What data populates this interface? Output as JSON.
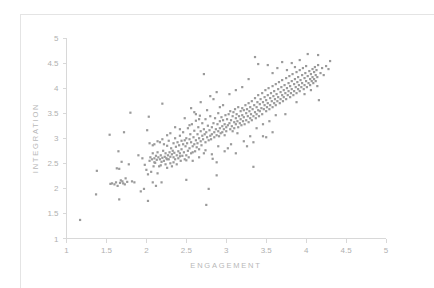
{
  "chart_data": {
    "type": "scatter",
    "title": "",
    "xlabel": "ENGAGEMENT",
    "ylabel": "INTEGRATION",
    "xlim": [
      1,
      5
    ],
    "ylim": [
      1,
      5
    ],
    "xticks": [
      1,
      1.5,
      2,
      2.5,
      3,
      3.5,
      4,
      4.5,
      5
    ],
    "yticks": [
      1,
      1.5,
      2,
      2.5,
      3,
      3.5,
      4,
      4.5,
      5
    ],
    "xtick_labels": [
      "1",
      "1.5",
      "2",
      "2.5",
      "3",
      "3.5",
      "4",
      "4.5",
      "5"
    ],
    "ytick_labels": [
      "1",
      "1.5",
      "2",
      "2.5",
      "3",
      "3.5",
      "4",
      "4.5",
      "5"
    ],
    "grid": false,
    "legend": null,
    "marker": "square",
    "marker_size": 2.2,
    "marker_color": "#9a9a9a",
    "axis_color": "#d8d8d8",
    "label_color": "#b4b4b4",
    "n_points": 392,
    "correlation": 0.85,
    "points": [
      [
        1.17,
        1.37
      ],
      [
        1.37,
        1.88
      ],
      [
        1.38,
        2.35
      ],
      [
        1.54,
        3.07
      ],
      [
        1.55,
        2.09
      ],
      [
        1.57,
        2.1
      ],
      [
        1.6,
        2.08
      ],
      [
        1.62,
        2.12
      ],
      [
        1.63,
        2.4
      ],
      [
        1.64,
        2.05
      ],
      [
        1.65,
        2.74
      ],
      [
        1.66,
        2.39
      ],
      [
        1.66,
        1.78
      ],
      [
        1.67,
        2.11
      ],
      [
        1.68,
        2.16
      ],
      [
        1.69,
        2.53
      ],
      [
        1.7,
        2.14
      ],
      [
        1.71,
        2.1
      ],
      [
        1.72,
        3.12
      ],
      [
        1.73,
        2.08
      ],
      [
        1.74,
        2.2
      ],
      [
        1.76,
        2.13
      ],
      [
        1.78,
        2.48
      ],
      [
        1.8,
        3.51
      ],
      [
        1.82,
        2.14
      ],
      [
        1.85,
        2.12
      ],
      [
        1.9,
        2.66
      ],
      [
        1.93,
        1.94
      ],
      [
        1.95,
        2.6
      ],
      [
        1.97,
        1.99
      ],
      [
        1.98,
        2.47
      ],
      [
        2.0,
        2.37
      ],
      [
        2.01,
        3.16
      ],
      [
        2.02,
        2.28
      ],
      [
        2.02,
        1.75
      ],
      [
        2.03,
        3.43
      ],
      [
        2.04,
        2.55
      ],
      [
        2.05,
        2.62
      ],
      [
        2.06,
        2.33
      ],
      [
        2.07,
        2.58
      ],
      [
        2.08,
        2.12
      ],
      [
        2.08,
        2.7
      ],
      [
        2.09,
        2.44
      ],
      [
        2.1,
        2.6
      ],
      [
        2.1,
        2.88
      ],
      [
        2.11,
        2.51
      ],
      [
        2.12,
        2.65
      ],
      [
        2.12,
        2.05
      ],
      [
        2.13,
        2.57
      ],
      [
        2.14,
        2.72
      ],
      [
        2.14,
        2.3
      ],
      [
        2.15,
        2.62
      ],
      [
        2.16,
        2.44
      ],
      [
        2.17,
        2.58
      ],
      [
        2.17,
        2.92
      ],
      [
        2.18,
        2.66
      ],
      [
        2.19,
        2.53
      ],
      [
        2.19,
        2.12
      ],
      [
        2.2,
        2.61
      ],
      [
        2.2,
        3.69
      ],
      [
        2.21,
        2.75
      ],
      [
        2.22,
        2.55
      ],
      [
        2.22,
        2.88
      ],
      [
        2.23,
        2.63
      ],
      [
        2.24,
        2.48
      ],
      [
        2.24,
        2.7
      ],
      [
        2.25,
        2.6
      ],
      [
        2.26,
        2.85
      ],
      [
        2.26,
        2.41
      ],
      [
        2.27,
        2.66
      ],
      [
        2.28,
        2.58
      ],
      [
        2.28,
        2.95
      ],
      [
        2.29,
        2.72
      ],
      [
        2.3,
        2.63
      ],
      [
        2.3,
        2.5
      ],
      [
        2.31,
        2.8
      ],
      [
        2.32,
        2.68
      ],
      [
        2.32,
        2.44
      ],
      [
        2.33,
        2.75
      ],
      [
        2.34,
        2.9
      ],
      [
        2.34,
        2.62
      ],
      [
        2.35,
        2.71
      ],
      [
        2.36,
        2.58
      ],
      [
        2.36,
        3.0
      ],
      [
        2.37,
        2.83
      ],
      [
        2.38,
        2.66
      ],
      [
        2.38,
        2.48
      ],
      [
        2.39,
        2.92
      ],
      [
        2.4,
        2.74
      ],
      [
        2.4,
        2.6
      ],
      [
        2.41,
        2.86
      ],
      [
        2.42,
        2.7
      ],
      [
        2.42,
        3.05
      ],
      [
        2.43,
        2.55
      ],
      [
        2.44,
        2.95
      ],
      [
        2.44,
        2.78
      ],
      [
        2.45,
        2.65
      ],
      [
        2.46,
        2.88
      ],
      [
        2.46,
        3.12
      ],
      [
        2.47,
        2.72
      ],
      [
        2.48,
        2.96
      ],
      [
        2.48,
        2.58
      ],
      [
        2.49,
        2.84
      ],
      [
        2.5,
        3.0
      ],
      [
        2.5,
        2.66
      ],
      [
        2.5,
        2.17
      ],
      [
        2.51,
        2.9
      ],
      [
        2.52,
        2.75
      ],
      [
        2.52,
        3.2
      ],
      [
        2.53,
        2.62
      ],
      [
        2.54,
        2.98
      ],
      [
        2.54,
        2.8
      ],
      [
        2.55,
        3.08
      ],
      [
        2.56,
        2.7
      ],
      [
        2.56,
        2.92
      ],
      [
        2.57,
        3.28
      ],
      [
        2.58,
        2.84
      ],
      [
        2.58,
        2.55
      ],
      [
        2.59,
        3.02
      ],
      [
        2.6,
        2.88
      ],
      [
        2.6,
        3.15
      ],
      [
        2.61,
        2.74
      ],
      [
        2.62,
        2.96
      ],
      [
        2.62,
        3.35
      ],
      [
        2.63,
        2.82
      ],
      [
        2.64,
        3.08
      ],
      [
        2.64,
        2.9
      ],
      [
        2.65,
        3.22
      ],
      [
        2.66,
        2.78
      ],
      [
        2.66,
        3.0
      ],
      [
        2.67,
        3.45
      ],
      [
        2.68,
        2.94
      ],
      [
        2.68,
        3.14
      ],
      [
        2.69,
        2.86
      ],
      [
        2.7,
        3.05
      ],
      [
        2.7,
        3.3
      ],
      [
        2.71,
        2.98
      ],
      [
        2.72,
        3.18
      ],
      [
        2.72,
        2.7
      ],
      [
        2.73,
        3.08
      ],
      [
        2.74,
        3.38
      ],
      [
        2.74,
        2.92
      ],
      [
        2.75,
        3.12
      ],
      [
        2.75,
        1.67
      ],
      [
        2.76,
        3.02
      ],
      [
        2.77,
        3.25
      ],
      [
        2.78,
        2.96
      ],
      [
        2.78,
        1.99
      ],
      [
        2.79,
        3.16
      ],
      [
        2.8,
        3.05
      ],
      [
        2.8,
        3.44
      ],
      [
        2.81,
        2.98
      ],
      [
        2.82,
        3.22
      ],
      [
        2.82,
        3.08
      ],
      [
        2.83,
        2.59
      ],
      [
        2.84,
        3.3
      ],
      [
        2.85,
        3.12
      ],
      [
        2.85,
        3.02
      ],
      [
        2.86,
        3.4
      ],
      [
        2.87,
        3.18
      ],
      [
        2.88,
        3.06
      ],
      [
        2.88,
        2.26
      ],
      [
        2.89,
        3.28
      ],
      [
        2.9,
        3.14
      ],
      [
        2.9,
        3.5
      ],
      [
        2.91,
        3.04
      ],
      [
        2.92,
        3.34
      ],
      [
        2.92,
        3.2
      ],
      [
        2.93,
        3.1
      ],
      [
        2.94,
        3.42
      ],
      [
        2.95,
        3.24
      ],
      [
        2.95,
        3.12
      ],
      [
        2.96,
        3.36
      ],
      [
        2.97,
        3.18
      ],
      [
        2.98,
        3.28
      ],
      [
        2.98,
        3.06
      ],
      [
        2.99,
        3.46
      ],
      [
        3.0,
        3.22
      ],
      [
        3.0,
        3.14
      ],
      [
        3.01,
        3.38
      ],
      [
        3.02,
        3.26
      ],
      [
        3.02,
        2.8
      ],
      [
        3.03,
        3.48
      ],
      [
        3.04,
        3.3
      ],
      [
        3.05,
        3.18
      ],
      [
        3.05,
        3.54
      ],
      [
        3.06,
        3.36
      ],
      [
        3.07,
        3.24
      ],
      [
        3.08,
        3.44
      ],
      [
        3.08,
        3.14
      ],
      [
        3.09,
        3.52
      ],
      [
        3.1,
        3.32
      ],
      [
        3.1,
        3.2
      ],
      [
        3.11,
        3.58
      ],
      [
        3.12,
        3.4
      ],
      [
        3.12,
        3.28
      ],
      [
        3.13,
        3.48
      ],
      [
        3.14,
        3.34
      ],
      [
        3.15,
        3.22
      ],
      [
        3.15,
        3.62
      ],
      [
        3.16,
        3.44
      ],
      [
        3.17,
        3.3
      ],
      [
        3.18,
        3.54
      ],
      [
        3.18,
        3.38
      ],
      [
        3.19,
        3.26
      ],
      [
        3.2,
        3.6
      ],
      [
        3.2,
        3.46
      ],
      [
        3.21,
        3.34
      ],
      [
        3.22,
        3.56
      ],
      [
        3.22,
        3.42
      ],
      [
        3.23,
        3.28
      ],
      [
        3.24,
        3.66
      ],
      [
        3.25,
        3.5
      ],
      [
        3.25,
        3.36
      ],
      [
        3.26,
        3.58
      ],
      [
        3.27,
        3.44
      ],
      [
        3.28,
        3.7
      ],
      [
        3.28,
        3.32
      ],
      [
        3.29,
        3.54
      ],
      [
        3.3,
        3.4
      ],
      [
        3.3,
        3.62
      ],
      [
        3.31,
        3.48
      ],
      [
        3.32,
        3.74
      ],
      [
        3.32,
        3.36
      ],
      [
        3.33,
        3.58
      ],
      [
        3.34,
        3.44
      ],
      [
        3.34,
        2.43
      ],
      [
        3.35,
        3.66
      ],
      [
        3.36,
        3.52
      ],
      [
        3.36,
        3.8
      ],
      [
        3.37,
        3.4
      ],
      [
        3.38,
        3.62
      ],
      [
        3.38,
        3.48
      ],
      [
        3.39,
        3.72
      ],
      [
        3.4,
        3.56
      ],
      [
        3.4,
        3.86
      ],
      [
        3.41,
        3.44
      ],
      [
        3.42,
        3.68
      ],
      [
        3.42,
        3.54
      ],
      [
        3.43,
        3.78
      ],
      [
        3.44,
        3.6
      ],
      [
        3.45,
        3.9
      ],
      [
        3.45,
        3.48
      ],
      [
        3.46,
        3.72
      ],
      [
        3.47,
        3.58
      ],
      [
        3.48,
        3.82
      ],
      [
        3.48,
        3.66
      ],
      [
        3.49,
        3.96
      ],
      [
        3.5,
        3.54
      ],
      [
        3.5,
        3.76
      ],
      [
        3.51,
        3.62
      ],
      [
        3.52,
        3.86
      ],
      [
        3.52,
        3.7
      ],
      [
        3.53,
        4.0
      ],
      [
        3.54,
        3.58
      ],
      [
        3.55,
        3.8
      ],
      [
        3.55,
        3.66
      ],
      [
        3.56,
        3.9
      ],
      [
        3.57,
        3.74
      ],
      [
        3.58,
        4.04
      ],
      [
        3.58,
        3.62
      ],
      [
        3.59,
        3.84
      ],
      [
        3.6,
        3.7
      ],
      [
        3.6,
        3.94
      ],
      [
        3.61,
        3.78
      ],
      [
        3.62,
        4.08
      ],
      [
        3.62,
        3.66
      ],
      [
        3.63,
        3.88
      ],
      [
        3.64,
        3.74
      ],
      [
        3.65,
        3.98
      ],
      [
        3.65,
        3.82
      ],
      [
        3.66,
        4.12
      ],
      [
        3.67,
        3.7
      ],
      [
        3.68,
        3.92
      ],
      [
        3.68,
        3.78
      ],
      [
        3.69,
        4.02
      ],
      [
        3.7,
        3.86
      ],
      [
        3.7,
        4.16
      ],
      [
        3.71,
        3.74
      ],
      [
        3.72,
        3.96
      ],
      [
        3.72,
        3.82
      ],
      [
        3.73,
        4.06
      ],
      [
        3.74,
        3.9
      ],
      [
        3.75,
        4.2
      ],
      [
        3.75,
        3.78
      ],
      [
        3.76,
        4.0
      ],
      [
        3.77,
        3.86
      ],
      [
        3.78,
        4.1
      ],
      [
        3.78,
        3.94
      ],
      [
        3.79,
        4.24
      ],
      [
        3.8,
        3.82
      ],
      [
        3.8,
        4.04
      ],
      [
        3.81,
        3.9
      ],
      [
        3.82,
        4.14
      ],
      [
        3.82,
        3.98
      ],
      [
        3.83,
        4.28
      ],
      [
        3.84,
        3.86
      ],
      [
        3.85,
        4.08
      ],
      [
        3.85,
        3.94
      ],
      [
        3.86,
        4.18
      ],
      [
        3.87,
        4.02
      ],
      [
        3.88,
        4.32
      ],
      [
        3.88,
        3.9
      ],
      [
        3.89,
        4.12
      ],
      [
        3.9,
        3.98
      ],
      [
        3.9,
        4.22
      ],
      [
        3.91,
        4.06
      ],
      [
        3.92,
        4.36
      ],
      [
        3.92,
        3.94
      ],
      [
        3.93,
        4.16
      ],
      [
        3.94,
        4.02
      ],
      [
        3.95,
        4.26
      ],
      [
        3.95,
        4.1
      ],
      [
        3.96,
        4.4
      ],
      [
        3.97,
        3.98
      ],
      [
        3.98,
        4.2
      ],
      [
        3.98,
        4.06
      ],
      [
        3.99,
        4.3
      ],
      [
        4.0,
        4.14
      ],
      [
        4.0,
        4.44
      ],
      [
        4.01,
        4.02
      ],
      [
        4.02,
        4.24
      ],
      [
        4.02,
        4.68
      ],
      [
        4.03,
        4.1
      ],
      [
        4.04,
        4.34
      ],
      [
        4.05,
        4.18
      ],
      [
        4.05,
        4.06
      ],
      [
        4.06,
        4.28
      ],
      [
        4.07,
        4.14
      ],
      [
        4.08,
        4.38
      ],
      [
        4.08,
        4.22
      ],
      [
        4.09,
        4.1
      ],
      [
        4.1,
        4.32
      ],
      [
        4.1,
        4.18
      ],
      [
        4.11,
        4.42
      ],
      [
        4.12,
        4.26
      ],
      [
        4.12,
        4.14
      ],
      [
        4.13,
        4.36
      ],
      [
        4.14,
        4.22
      ],
      [
        4.15,
        4.46
      ],
      [
        4.15,
        4.66
      ],
      [
        4.16,
        3.76
      ],
      [
        4.18,
        4.3
      ],
      [
        4.2,
        4.4
      ],
      [
        4.22,
        4.26
      ],
      [
        4.25,
        4.44
      ],
      [
        4.28,
        4.38
      ],
      [
        4.3,
        4.54
      ],
      [
        3.36,
        4.62
      ],
      [
        3.4,
        4.48
      ],
      [
        3.52,
        4.46
      ],
      [
        3.58,
        4.3
      ],
      [
        3.64,
        4.4
      ],
      [
        3.7,
        4.52
      ],
      [
        3.76,
        4.36
      ],
      [
        3.82,
        4.5
      ],
      [
        3.86,
        4.42
      ],
      [
        3.92,
        4.56
      ],
      [
        2.72,
        4.28
      ],
      [
        2.8,
        3.84
      ],
      [
        2.88,
        3.92
      ],
      [
        2.96,
        3.66
      ],
      [
        3.04,
        3.88
      ],
      [
        3.12,
        3.96
      ],
      [
        3.2,
        4.02
      ],
      [
        3.28,
        4.18
      ],
      [
        2.56,
        3.6
      ],
      [
        2.62,
        3.48
      ],
      [
        2.68,
        3.72
      ],
      [
        2.76,
        3.56
      ],
      [
        2.84,
        3.78
      ],
      [
        2.92,
        3.62
      ],
      [
        2.48,
        3.4
      ],
      [
        2.54,
        3.26
      ],
      [
        2.6,
        3.52
      ],
      [
        2.66,
        3.38
      ],
      [
        2.3,
        3.1
      ],
      [
        2.36,
        3.22
      ],
      [
        2.42,
        3.18
      ],
      [
        2.2,
        2.98
      ],
      [
        2.26,
        3.06
      ],
      [
        2.14,
        2.94
      ],
      [
        2.08,
        2.86
      ],
      [
        3.3,
        3.04
      ],
      [
        3.22,
        2.94
      ],
      [
        3.14,
        3.1
      ],
      [
        3.06,
        2.88
      ],
      [
        2.98,
        2.74
      ],
      [
        2.9,
        2.84
      ],
      [
        2.82,
        2.68
      ],
      [
        2.74,
        2.76
      ],
      [
        2.66,
        2.62
      ],
      [
        2.58,
        2.72
      ],
      [
        2.5,
        2.56
      ],
      [
        2.42,
        2.64
      ],
      [
        2.34,
        2.52
      ],
      [
        2.26,
        2.58
      ],
      [
        2.18,
        2.46
      ],
      [
        2.1,
        2.52
      ],
      [
        3.38,
        3.2
      ],
      [
        3.46,
        3.28
      ],
      [
        3.54,
        3.34
      ],
      [
        3.62,
        3.46
      ],
      [
        3.34,
        2.92
      ],
      [
        3.5,
        3.02
      ],
      [
        3.58,
        3.12
      ],
      [
        3.74,
        3.48
      ],
      [
        3.88,
        3.72
      ],
      [
        3.98,
        3.88
      ],
      [
        4.06,
        3.96
      ],
      [
        4.14,
        4.04
      ],
      [
        3.46,
        3.04
      ],
      [
        2.04,
        2.9
      ],
      [
        2.88,
        2.52
      ],
      [
        3.12,
        2.7
      ],
      [
        3.26,
        2.84
      ]
    ]
  },
  "axes": {
    "x_title": "ENGAGEMENT",
    "y_title": "INTEGRATION"
  }
}
